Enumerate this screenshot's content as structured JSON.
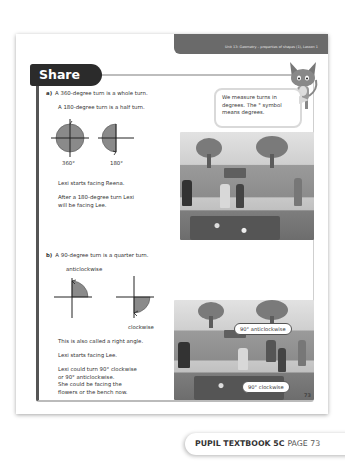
{
  "header": {
    "unit_banner": "Unit 13: Geometry – properties of shapes (1), Lesson 1"
  },
  "section": {
    "title": "Share"
  },
  "speech_bubble": {
    "line1": "We measure turns in",
    "line2": "degrees. The ° symbol",
    "line3": "means degrees."
  },
  "part_a": {
    "label": "a)",
    "line1": "A 360-degree turn is a whole turn.",
    "line2": "A 180-degree turn is a half turn.",
    "diagram_labels": [
      "360°",
      "180°"
    ],
    "text1": "Lexi starts facing Reena.",
    "text2_line1": "After a 180-degree turn Lexi",
    "text2_line2": "will be facing Lee."
  },
  "part_b": {
    "label": "b)",
    "line1": "A 90-degree turn is a quarter turn.",
    "diagram_labels": [
      "anticlockwise",
      "clockwise"
    ],
    "text1": "This is also called a right angle.",
    "text2": "Lexi starts facing Lee.",
    "text3_line1": "Lexi could turn 90° clockwise",
    "text3_line2": "or 90° anticlockwise.",
    "text3_line3": "She could be facing the",
    "text3_line4": "flowers or the bench now.",
    "callouts": [
      "90° anticlockwise",
      "90° clockwise"
    ]
  },
  "footer": {
    "page_number": "73",
    "book": "PUPIL TEXTBOOK 5C",
    "page": "PAGE 73"
  },
  "colors": {
    "banner": "#6a6a6a",
    "share_tab": "#2b2b2b",
    "sector_fill": "#8a8a8a"
  }
}
